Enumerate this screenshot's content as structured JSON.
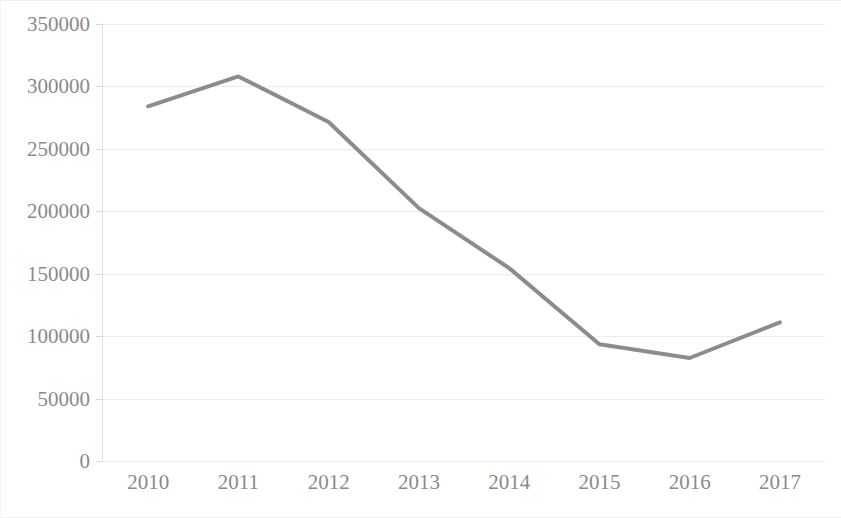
{
  "chart_data": {
    "type": "line",
    "title": "",
    "subtitle": "",
    "xlabel": "",
    "ylabel": "",
    "categories": [
      "2010",
      "2011",
      "2012",
      "2013",
      "2014",
      "2015",
      "2016",
      "2017"
    ],
    "series": [
      {
        "name": "Series 1",
        "values": [
          284000,
          308000,
          271500,
          202500,
          154500,
          93500,
          82500,
          111000
        ],
        "color": "#8c8c8c",
        "line_width": 4,
        "markers": false
      }
    ],
    "ylim": [
      0,
      350000
    ],
    "y_ticks": [
      0,
      50000,
      100000,
      150000,
      200000,
      250000,
      300000,
      350000
    ],
    "y_tick_labels": [
      "0",
      "50000",
      "100000",
      "150000",
      "200000",
      "250000",
      "300000",
      "350000"
    ],
    "x_tick_labels": [
      "2010",
      "2011",
      "2012",
      "2013",
      "2014",
      "2015",
      "2016",
      "2017"
    ],
    "grid": true,
    "grid_axis": "y",
    "grid_color": "#ededed",
    "legend": false,
    "legend_position": "none",
    "background_color": "#ffffff",
    "axis_label_color": "#8a8a8a",
    "annotations": []
  }
}
